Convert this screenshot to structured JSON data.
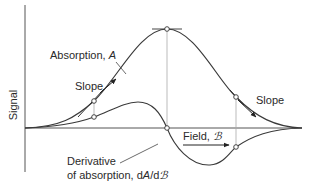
{
  "diagram": {
    "y_axis_label": "Signal",
    "x_axis_label": "Field, ",
    "x_axis_symbol": "ℬ",
    "absorption_label": "Absorption, ",
    "absorption_symbol": "A",
    "slope_left_label": "Slope",
    "slope_right_label": "Slope",
    "derivative_label_line1": "Derivative",
    "derivative_label_line2": "of absorption, d",
    "derivative_symbol_A": "A",
    "derivative_slash_d": "/d",
    "derivative_symbol_B": "ℬ",
    "colors": {
      "curve": "#3a3a3a",
      "axis": "#555555",
      "guide": "#aaaaaa",
      "text": "#2a2a2a"
    }
  }
}
